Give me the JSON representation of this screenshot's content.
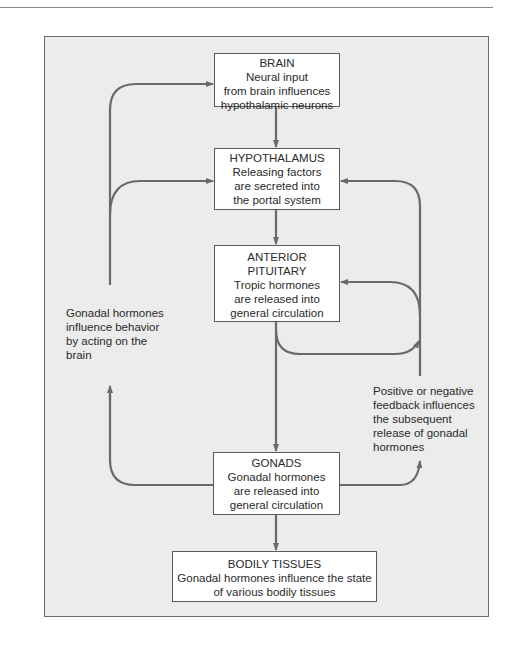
{
  "diagram": {
    "colors": {
      "frame_fill": "#ececec",
      "frame_border": "#6a6a6a",
      "box_fill": "#ffffff",
      "box_border": "#5a5a5a",
      "arrow": "#6a6a6a",
      "text": "#2a2a2a"
    },
    "nodes": {
      "brain": {
        "title": "BRAIN",
        "lines": [
          "Neural input",
          "from brain influences",
          "hypothalamic neurons"
        ]
      },
      "hypothalamus": {
        "title": "HYPOTHALAMUS",
        "lines": [
          "Releasing factors",
          "are secreted into",
          "the portal system"
        ]
      },
      "pituitary": {
        "title": [
          "ANTERIOR",
          "PITUITARY"
        ],
        "lines": [
          "Tropic hormones",
          "are released into",
          "general circulation"
        ]
      },
      "gonads": {
        "title": "GONADS",
        "lines": [
          "Gonadal hormones",
          "are released into",
          "general circulation"
        ]
      },
      "bodily_tissues": {
        "title": "BODILY TISSUES",
        "lines": [
          "Gonadal hormones influence the state",
          "of various bodily tissues"
        ]
      }
    },
    "annotations": {
      "left": [
        "Gonadal hormones",
        "influence behavior",
        "by acting on the",
        "brain"
      ],
      "right": [
        "Positive or negative",
        "feedback influences",
        "the subsequent",
        "release of gonadal",
        "hormones"
      ]
    },
    "edges": [
      {
        "from": "brain",
        "to": "hypothalamus"
      },
      {
        "from": "hypothalamus",
        "to": "pituitary"
      },
      {
        "from": "pituitary",
        "to": "gonads"
      },
      {
        "from": "gonads",
        "to": "bodily_tissues"
      },
      {
        "from": "gonads",
        "to": "brain",
        "label": "left"
      },
      {
        "from": "gonads",
        "to": "hypothalamus",
        "label": "left"
      },
      {
        "from": "pituitary",
        "to": "feedback",
        "label": "right"
      },
      {
        "from": "gonads",
        "to": "feedback",
        "label": "right"
      },
      {
        "from": "feedback",
        "to": "hypothalamus"
      },
      {
        "from": "feedback",
        "to": "pituitary"
      }
    ]
  }
}
